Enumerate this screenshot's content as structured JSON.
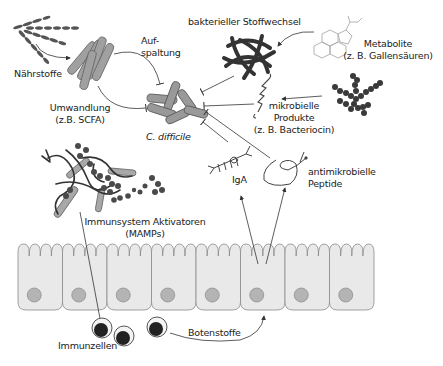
{
  "diagram": {
    "labels": {
      "naehrstoffe": "Nährstoffe",
      "aufspaltung_1": "Auf-",
      "aufspaltung_2": "spaltung",
      "umwandlung_1": "Umwandlung",
      "umwandlung_2": "(z.B. SCFA)",
      "c_difficile": "C. difficile",
      "bakterieller_stoffwechsel": "bakterieller Stoffwechsel",
      "metabolite_1": "Metabolite",
      "metabolite_2": "(z. B. Gallensäuren)",
      "mikrobielle_1": "mikrobielle",
      "mikrobielle_2": "Produkte",
      "mikrobielle_3": "(z. B. Bacteriocin)",
      "antimikrobielle_1": "antimikrobielle",
      "antimikrobielle_2": "Peptide",
      "iga": "IgA",
      "immunsystem_1": "Immunsystem Aktivatoren",
      "immunsystem_2": "(MAMPs)",
      "immunzellen": "Immunzellen",
      "botenstoffe": "Botenstoffe"
    },
    "colors": {
      "cell_fill": "#e9e9e9",
      "cell_stroke": "#8a8a8a",
      "nucleus": "#b4b4b4",
      "bacteria_fill": "#9a9a9a",
      "dark": "#333333",
      "line": "#333333"
    },
    "epithelium_cell_count": 8
  }
}
